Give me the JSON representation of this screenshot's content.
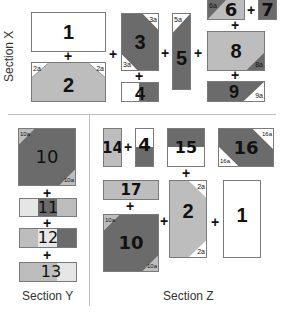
{
  "colors": {
    "dark": "#6b6b6b",
    "mid": "#bdbdbd",
    "light": "#e6e6e6",
    "white": "#ffffff",
    "border": "#7a7a7a"
  },
  "sections": {
    "x": {
      "label": "Section X",
      "blocks": {
        "b1": {
          "num": "1"
        },
        "b2": {
          "num": "2",
          "corner_a": "2a",
          "corner_b": "2a"
        },
        "b3": {
          "num": "3",
          "corner_a": "3a",
          "corner_b": "3a"
        },
        "b4": {
          "num": "4"
        },
        "b5": {
          "num": "5",
          "corner_a": "5a"
        },
        "b6": {
          "num": "6",
          "corner_a": "6a"
        },
        "b7": {
          "num": "7"
        },
        "b8": {
          "num": "8",
          "corner_a": "8a"
        },
        "b9": {
          "num": "9",
          "corner_a": "9a"
        }
      }
    },
    "y": {
      "label": "Section Y",
      "blocks": {
        "b10": {
          "num": "10",
          "corner_a": "10a",
          "corner_b": "10a"
        },
        "b11": {
          "num": "11"
        },
        "b12": {
          "num": "12"
        },
        "b13": {
          "num": "13"
        }
      }
    },
    "z": {
      "label": "Section Z",
      "blocks": {
        "b14": {
          "num": "14"
        },
        "b4": {
          "num": "4"
        },
        "b15": {
          "num": "15"
        },
        "b16": {
          "num": "16",
          "corner_a": "16a",
          "corner_b": "16a"
        },
        "b17": {
          "num": "17"
        },
        "b10": {
          "num": "10",
          "corner_a": "10a",
          "corner_b": "10a"
        },
        "b2": {
          "num": "2",
          "corner_a": "2a",
          "corner_b": "2a"
        },
        "b1": {
          "num": "1"
        }
      }
    }
  },
  "operator": "+"
}
